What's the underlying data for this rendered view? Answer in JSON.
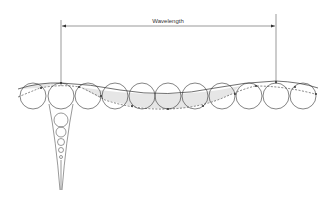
{
  "diagram": {
    "label_wavelength": "Wavelength",
    "colors": {
      "stroke": "#333333",
      "shade": "#e6e6e6",
      "background": "#ffffff"
    },
    "orbit_circles": {
      "centers_x": [
        33,
        61,
        88,
        115,
        142,
        168,
        195,
        222,
        249,
        276,
        303
      ],
      "center_y": 96,
      "radius": 13
    },
    "depth_circles": [
      {
        "cx": 61,
        "cy": 120,
        "r": 7
      },
      {
        "cx": 61,
        "cy": 132,
        "r": 5
      },
      {
        "cx": 61,
        "cy": 142,
        "r": 3.5
      },
      {
        "cx": 61,
        "cy": 150,
        "r": 2.5
      },
      {
        "cx": 61,
        "cy": 157,
        "r": 1.5
      }
    ],
    "wavelength_markers_x": [
      61,
      276
    ]
  }
}
